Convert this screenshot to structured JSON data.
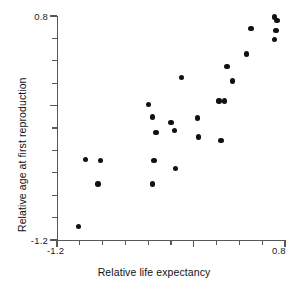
{
  "chart_data": {
    "type": "scatter",
    "title": "",
    "xlabel": "Relative life expectancy",
    "ylabel": "Relative age at first reproduction",
    "xlim": [
      -1.2,
      0.8
    ],
    "ylim": [
      -1.2,
      0.8
    ],
    "xticks": [
      -1.2,
      -1.0,
      -0.8,
      -0.6,
      -0.4,
      -0.2,
      0.0,
      0.2,
      0.4,
      0.6,
      0.8
    ],
    "yticks": [
      -1.2,
      -1.0,
      -0.8,
      -0.6,
      -0.4,
      -0.2,
      0.0,
      0.2,
      0.4,
      0.6,
      0.8
    ],
    "xtick_labels": [
      "-1.2",
      "",
      "",
      "",
      "",
      "",
      "0.0",
      "",
      "",
      "",
      "0.8"
    ],
    "ytick_labels": [
      "-1.2",
      "",
      "",
      "",
      "",
      "",
      "0.0",
      "",
      "",
      "",
      "0.8"
    ],
    "grid": false,
    "legend": null,
    "marker": "filled-circle",
    "marker_color": "#111111",
    "axis_color": "#595959",
    "points": [
      {
        "x": -1.01,
        "y": -1.08
      },
      {
        "x": -0.95,
        "y": -0.48
      },
      {
        "x": -0.82,
        "y": -0.49
      },
      {
        "x": -0.84,
        "y": -0.7
      },
      {
        "x": -0.4,
        "y": 0.01
      },
      {
        "x": -0.36,
        "y": -0.1
      },
      {
        "x": -0.35,
        "y": -0.49
      },
      {
        "x": -0.36,
        "y": -0.7
      },
      {
        "x": -0.33,
        "y": -0.24
      },
      {
        "x": -0.2,
        "y": -0.15
      },
      {
        "x": -0.17,
        "y": -0.22
      },
      {
        "x": -0.16,
        "y": -0.56
      },
      {
        "x": -0.11,
        "y": 0.25
      },
      {
        "x": 0.03,
        "y": -0.11
      },
      {
        "x": 0.04,
        "y": -0.28
      },
      {
        "x": 0.22,
        "y": 0.04
      },
      {
        "x": 0.27,
        "y": 0.04
      },
      {
        "x": 0.24,
        "y": -0.31
      },
      {
        "x": 0.29,
        "y": 0.35
      },
      {
        "x": 0.34,
        "y": 0.22
      },
      {
        "x": 0.46,
        "y": 0.46
      },
      {
        "x": 0.5,
        "y": 0.69
      },
      {
        "x": 0.71,
        "y": 0.79
      },
      {
        "x": 0.73,
        "y": 0.76
      },
      {
        "x": 0.72,
        "y": 0.67
      },
      {
        "x": 0.71,
        "y": 0.59
      }
    ]
  },
  "axes": {
    "x": {
      "label": "Relative life expectancy",
      "min_label": "-1.2",
      "max_label": "0.8"
    },
    "y": {
      "label": "Relative age at first reproduction",
      "min_label": "-1.2",
      "max_label": "0.8"
    }
  }
}
